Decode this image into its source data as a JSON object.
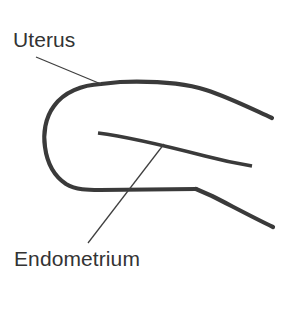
{
  "figure": {
    "background_color": "#ffffff",
    "stroke_color": "#3a3a3a",
    "leader_color": "#3f3f3f",
    "text_color": "#333333",
    "width": 296,
    "height": 309
  },
  "labels": {
    "uterus": "Uterus",
    "endometrium": "Endometrium"
  },
  "diagram_data": {
    "type": "anatomical-line-drawing",
    "subject": "Uterus",
    "parts": [
      {
        "name": "uterus",
        "label": "Uterus",
        "description": "Outer uterine wall outline, rounded fundus at left opening toward right",
        "label_position": {
          "x": 13,
          "y": 29
        },
        "leader_from": {
          "x": 36,
          "y": 57
        },
        "leader_to": {
          "x": 101,
          "y": 84
        }
      },
      {
        "name": "endometrium",
        "label": "Endometrium",
        "description": "Inner uterine lining line within the uterine cavity",
        "label_position": {
          "x": 14,
          "y": 248
        },
        "leader_from": {
          "x": 88,
          "y": 243
        },
        "leader_to": {
          "x": 164,
          "y": 144
        }
      }
    ],
    "strokes": [
      {
        "name": "outer-wall-superior-and-fundus",
        "path": "M272,118 C250,108 228,97 206,90 C184,83 150,81 120,82 L101,84 C82,85 64,92 54,106 C45,118 43,134 45,147 C47,162 54,176 66,184 C76,190 88,190 100,190 L196,189"
      },
      {
        "name": "outer-wall-inferior",
        "path": "M196,189 L212,196 C228,204 252,217 273,227"
      },
      {
        "name": "endometrium-lining",
        "path": "M98,133 C130,137 170,147 205,156 C224,161 240,164 252,166"
      }
    ]
  }
}
